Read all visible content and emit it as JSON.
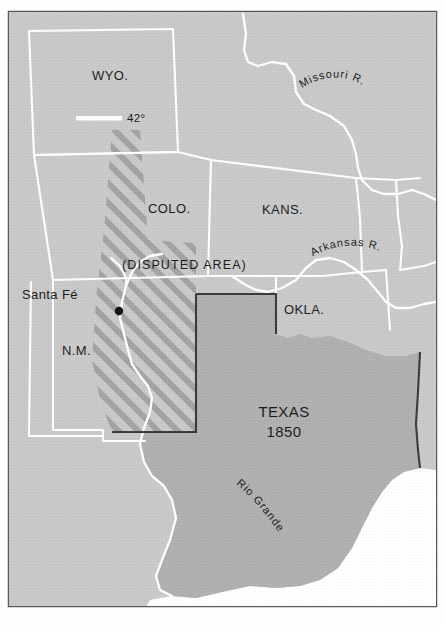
{
  "map": {
    "title": "Texas 1850",
    "frame": {
      "border_color": "#5a5a5a",
      "background_color": "#c9c9c9",
      "page_color": "#fefefe"
    },
    "colors": {
      "land_background": "#c9c9c9",
      "texas_fill": "#b0b0b0",
      "water_white": "#ffffff",
      "border_white": "#ffffff",
      "claim_line": "#3a3a3a",
      "hatch_stroke": "#9a9a9a",
      "text": "#1d1d1d"
    },
    "states": [
      {
        "id": "wyoming",
        "label": "WYO.",
        "x": 92,
        "y": 80
      },
      {
        "id": "colorado",
        "label": "COLO.",
        "x": 148,
        "y": 213
      },
      {
        "id": "kansas",
        "label": "KANS.",
        "x": 262,
        "y": 214
      },
      {
        "id": "new-mexico",
        "label": "N.M.",
        "x": 62,
        "y": 355
      },
      {
        "id": "oklahoma",
        "label": "OKLA.",
        "x": 284,
        "y": 314
      }
    ],
    "cities": [
      {
        "id": "santa-fe",
        "label": "Santa Fé",
        "label_x": 78,
        "label_y": 299,
        "dot_x": 119,
        "dot_y": 311
      }
    ],
    "areas": [
      {
        "id": "disputed-area",
        "label": "(DISPUTED AREA)",
        "x": 122,
        "y": 269
      },
      {
        "id": "texas-claim",
        "label_line1": "TEXAS",
        "label_line2": "1850",
        "x": 284,
        "y": 417
      }
    ],
    "rivers": [
      {
        "id": "missouri-river",
        "label": "Missouri R."
      },
      {
        "id": "arkansas-river",
        "label": "Arkansas R."
      },
      {
        "id": "rio-grande",
        "label": "Rio Grande"
      }
    ],
    "coordinates": [
      {
        "id": "latitude-42",
        "label": "42°",
        "x": 127,
        "y": 122
      }
    ]
  }
}
